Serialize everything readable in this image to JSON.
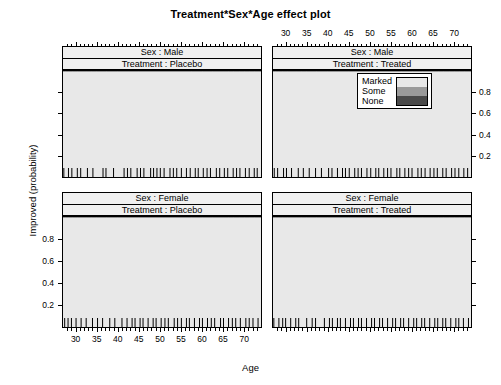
{
  "chart_data": {
    "type": "area",
    "title": "Treatment*Sex*Age effect plot",
    "xlabel": "Age",
    "ylabel": "Improved (probability)",
    "xlim": [
      27,
      74
    ],
    "ylim": [
      0,
      1
    ],
    "x_ticks": [
      30,
      35,
      40,
      45,
      50,
      55,
      60,
      65,
      70
    ],
    "y_ticks": [
      0.2,
      0.4,
      0.6,
      0.8
    ],
    "stacking": "cumulative-proportional-odds",
    "legend": {
      "position": "top-right-panel",
      "entries": [
        {
          "label": "Marked",
          "color": "#e8e8e8"
        },
        {
          "label": "Some",
          "color": "#9a9a9a"
        },
        {
          "label": "None",
          "color": "#4a4a4a"
        }
      ]
    },
    "panels": [
      {
        "id": "male-placebo",
        "row": 0,
        "col": 0,
        "strip_top": "Sex : Male",
        "strip_bottom": "Treatment : Placebo",
        "x_axis_labeled": false,
        "y_axis_labeled": false,
        "x": [
          27,
          35,
          45,
          55,
          65,
          74
        ],
        "series": [
          {
            "name": "None",
            "values": [
              0.975,
              0.965,
              0.945,
              0.915,
              0.868,
              0.812
            ]
          },
          {
            "name": "Some",
            "values": [
              0.01,
              0.013,
              0.021,
              0.032,
              0.049,
              0.07
            ]
          },
          {
            "name": "Marked",
            "values": [
              0.015,
              0.022,
              0.034,
              0.053,
              0.083,
              0.118
            ]
          }
        ],
        "rug_x": [
          27.2,
          28.3,
          29.1,
          30.4,
          31.2,
          32.8,
          34.1,
          36.5,
          37.2,
          39.0,
          41.5,
          42.3,
          43.1,
          44.6,
          45.4,
          46.2,
          47.8,
          48.5,
          49.3,
          50.1,
          51.0,
          52.4,
          53.2,
          54.0,
          55.1,
          56.3,
          57.2,
          58.4,
          59.1,
          60.3,
          61.2,
          62.0,
          63.4,
          64.2,
          65.3,
          66.1,
          67.4,
          68.2,
          69.0,
          70.3,
          71.2,
          72.4,
          73.1
        ]
      },
      {
        "id": "male-treated",
        "row": 0,
        "col": 1,
        "strip_top": "Sex : Male",
        "strip_bottom": "Treatment : Treated",
        "x_axis_labeled": true,
        "y_axis_labeled": true,
        "x": [
          27,
          35,
          45,
          55,
          65,
          74
        ],
        "series": [
          {
            "name": "None",
            "values": [
              0.88,
              0.808,
              0.7,
              0.575,
              0.455,
              0.365
            ]
          },
          {
            "name": "Some",
            "values": [
              0.048,
              0.073,
              0.107,
              0.14,
              0.159,
              0.163
            ]
          },
          {
            "name": "Marked",
            "values": [
              0.072,
              0.119,
              0.193,
              0.285,
              0.386,
              0.472
            ]
          }
        ],
        "rug_x": [
          27.3,
          28.1,
          29.5,
          30.2,
          31.4,
          33.0,
          34.2,
          35.6,
          37.1,
          38.5,
          40.2,
          41.0,
          42.3,
          43.5,
          44.2,
          45.1,
          46.4,
          47.2,
          48.0,
          49.3,
          50.2,
          51.4,
          52.1,
          53.3,
          54.2,
          55.0,
          56.4,
          57.1,
          58.3,
          59.2,
          60.0,
          61.4,
          62.2,
          63.1,
          64.3,
          65.2,
          66.0,
          67.3,
          68.1,
          69.4,
          70.2,
          71.1,
          72.3,
          73.2
        ]
      },
      {
        "id": "female-placebo",
        "row": 1,
        "col": 0,
        "strip_top": "Sex : Female",
        "strip_bottom": "Treatment : Placebo",
        "x_axis_labeled": true,
        "y_axis_labeled": true,
        "x": [
          27,
          35,
          45,
          55,
          65,
          74
        ],
        "series": [
          {
            "name": "None",
            "values": [
              0.872,
              0.8,
              0.69,
              0.565,
              0.44,
              0.34
            ]
          },
          {
            "name": "Some",
            "values": [
              0.052,
              0.077,
              0.11,
              0.142,
              0.16,
              0.163
            ]
          },
          {
            "name": "Marked",
            "values": [
              0.076,
              0.123,
              0.2,
              0.293,
              0.4,
              0.497
            ]
          }
        ],
        "rug_x": [
          27.4,
          28.2,
          29.0,
          30.1,
          31.3,
          32.5,
          34.0,
          35.2,
          36.4,
          38.1,
          39.3,
          41.0,
          42.2,
          43.4,
          44.1,
          45.3,
          46.0,
          47.2,
          48.4,
          49.1,
          50.3,
          51.2,
          52.0,
          53.4,
          54.2,
          55.1,
          56.3,
          57.0,
          58.2,
          59.4,
          60.1,
          61.3,
          62.2,
          63.0,
          64.4,
          65.1,
          66.3,
          67.2,
          68.0,
          69.1,
          70.4,
          71.2,
          72.1,
          73.3
        ]
      },
      {
        "id": "female-treated",
        "row": 1,
        "col": 1,
        "strip_top": "Sex : Female",
        "strip_bottom": "Treatment : Treated",
        "x_axis_labeled": false,
        "y_axis_labeled": false,
        "x": [
          27,
          35,
          45,
          55,
          65,
          74
        ],
        "series": [
          {
            "name": "None",
            "values": [
              0.45,
              0.36,
              0.262,
              0.18,
              0.12,
              0.082
            ]
          },
          {
            "name": "Some",
            "values": [
              0.13,
              0.128,
              0.118,
              0.1,
              0.078,
              0.06
            ]
          },
          {
            "name": "Marked",
            "values": [
              0.42,
              0.512,
              0.62,
              0.72,
              0.802,
              0.858
            ]
          }
        ],
        "rug_x": [
          27.2,
          28.4,
          29.3,
          30.0,
          31.2,
          32.4,
          33.1,
          35.0,
          36.3,
          37.1,
          39.2,
          40.4,
          41.1,
          42.3,
          43.0,
          44.2,
          45.4,
          46.1,
          47.3,
          48.0,
          49.2,
          50.4,
          51.1,
          52.3,
          53.0,
          54.2,
          55.4,
          56.1,
          57.3,
          58.0,
          59.2,
          60.4,
          61.1,
          62.3,
          63.0,
          64.2,
          65.4,
          66.1,
          67.3,
          68.0,
          69.2,
          70.4,
          71.1,
          72.2,
          73.4
        ]
      }
    ]
  }
}
